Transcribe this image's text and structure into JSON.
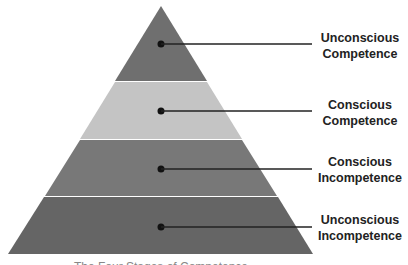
{
  "diagram": {
    "type": "pyramid",
    "levels": [
      {
        "label_line1": "Unconscious",
        "label_line2": "Competence",
        "color": "#6f6f6f"
      },
      {
        "label_line1": "Conscious",
        "label_line2": "Competence",
        "color": "#c4c4c4"
      },
      {
        "label_line1": "Conscious",
        "label_line2": "Incompetence",
        "color": "#787878"
      },
      {
        "label_line1": "Unconscious",
        "label_line2": "Incompetence",
        "color": "#656565"
      }
    ],
    "caption": "The Four Stages of Competence"
  }
}
